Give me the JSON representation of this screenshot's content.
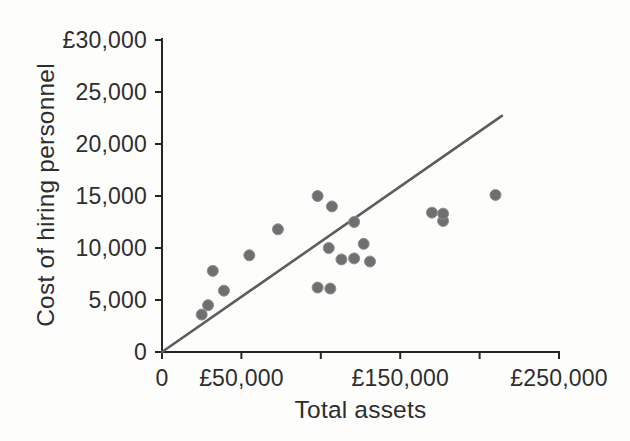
{
  "chart_data": {
    "type": "scatter",
    "title": "",
    "xlabel": "Total assets",
    "ylabel": "Cost of hiring personnel",
    "xlim": [
      0,
      250000
    ],
    "ylim": [
      0,
      30000
    ],
    "grid": false,
    "legend_position": "none",
    "x_ticks": [
      {
        "value": 0,
        "label": "0"
      },
      {
        "value": 50000,
        "label": "£50,000"
      },
      {
        "value": 100000,
        "label": ""
      },
      {
        "value": 150000,
        "label": "£150,000"
      },
      {
        "value": 200000,
        "label": ""
      },
      {
        "value": 250000,
        "label": "£250,000"
      }
    ],
    "y_ticks": [
      {
        "value": 0,
        "label": "0"
      },
      {
        "value": 5000,
        "label": "5,000"
      },
      {
        "value": 10000,
        "label": "10,000"
      },
      {
        "value": 15000,
        "label": "15,000"
      },
      {
        "value": 20000,
        "label": "20,000"
      },
      {
        "value": 25000,
        "label": "25,000"
      },
      {
        "value": 30000,
        "label": "£30,000"
      }
    ],
    "points": [
      [
        25000,
        3600
      ],
      [
        29000,
        4500
      ],
      [
        32000,
        7800
      ],
      [
        39000,
        5900
      ],
      [
        55000,
        9300
      ],
      [
        73000,
        11800
      ],
      [
        98000,
        6200
      ],
      [
        98000,
        15000
      ],
      [
        105000,
        10000
      ],
      [
        106000,
        6100
      ],
      [
        107000,
        14000
      ],
      [
        113000,
        8900
      ],
      [
        121000,
        9000
      ],
      [
        121000,
        12500
      ],
      [
        127000,
        10400
      ],
      [
        131000,
        8700
      ],
      [
        170000,
        13400
      ],
      [
        177000,
        12600
      ],
      [
        177000,
        13300
      ],
      [
        210000,
        15100
      ]
    ],
    "trendline": {
      "x1": 0,
      "y1": 0,
      "x2": 214000,
      "y2": 22700
    },
    "colors": {
      "point": "#6f6f6f",
      "point_edge": "#8f8f8f",
      "trend": "#5d5d5d",
      "axis": "#262626",
      "text": "#2e2e2e",
      "background": "#fdfdfc"
    }
  }
}
